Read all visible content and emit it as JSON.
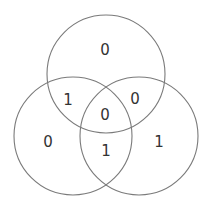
{
  "diagram": {
    "type": "venn-3",
    "stroke_color": "#7a7a7a",
    "text_color": "#333333",
    "circles": [
      {
        "id": "top",
        "cx": 106,
        "cy": 74,
        "r": 59
      },
      {
        "id": "left",
        "cx": 73,
        "cy": 136,
        "r": 59
      },
      {
        "id": "right",
        "cx": 139,
        "cy": 136,
        "r": 59
      }
    ],
    "regions": [
      {
        "id": "top-only",
        "value": "0",
        "x": 105,
        "y": 50
      },
      {
        "id": "top-left",
        "value": "1",
        "x": 68,
        "y": 100
      },
      {
        "id": "top-right",
        "value": "0",
        "x": 135,
        "y": 99
      },
      {
        "id": "center",
        "value": "0",
        "x": 105,
        "y": 115
      },
      {
        "id": "left-only",
        "value": "0",
        "x": 48,
        "y": 142
      },
      {
        "id": "right-only",
        "value": "1",
        "x": 159,
        "y": 142
      },
      {
        "id": "left-right",
        "value": "1",
        "x": 106,
        "y": 151
      }
    ]
  }
}
